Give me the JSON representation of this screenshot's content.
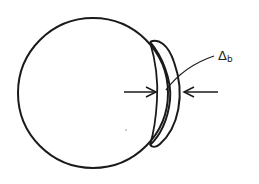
{
  "figure": {
    "type": "schematic",
    "stroke_color": "#1a1a1a",
    "background": "#ffffff"
  },
  "label": {
    "symbol": "Δ",
    "subscript": "b"
  },
  "annotations": {
    "dimension": "thickness arrows pointing inward across crescent"
  }
}
